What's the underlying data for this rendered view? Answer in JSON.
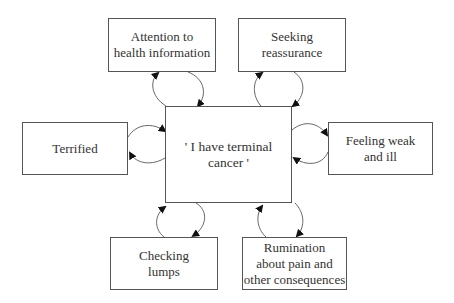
{
  "diagram": {
    "type": "cognitive-behavioural maintenance cycle",
    "center": {
      "id": "center",
      "label": "' I have terminal cancer '"
    },
    "nodes": [
      {
        "id": "attention",
        "label": "Attention to\nhealth information"
      },
      {
        "id": "reassurance",
        "label": "Seeking\nreassurance"
      },
      {
        "id": "terrified",
        "label": "Terrified"
      },
      {
        "id": "weak",
        "label": "Feeling weak\nand ill"
      },
      {
        "id": "checking",
        "label": "Checking\nlumps"
      },
      {
        "id": "rumination",
        "label": "Rumination\nabout pain and\nother consequences"
      }
    ],
    "edges": [
      {
        "from": "attention",
        "to": "center",
        "bidirectional": true
      },
      {
        "from": "reassurance",
        "to": "center",
        "bidirectional": true
      },
      {
        "from": "terrified",
        "to": "center",
        "bidirectional": true
      },
      {
        "from": "weak",
        "to": "center",
        "bidirectional": true
      },
      {
        "from": "checking",
        "to": "center",
        "bidirectional": true
      },
      {
        "from": "rumination",
        "to": "center",
        "bidirectional": true
      }
    ]
  },
  "colors": {
    "line": "#555555",
    "text": "#333333",
    "background": "#ffffff"
  }
}
